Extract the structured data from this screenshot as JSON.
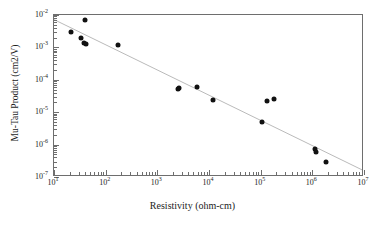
{
  "chart_data": {
    "type": "scatter",
    "title": "",
    "xlabel": "Resistivity (ohm-cm)",
    "ylabel": "Mu-Tau Product (cm2/V)",
    "xscale": "log",
    "yscale": "log",
    "xlim": [
      10,
      10000000
    ],
    "ylim": [
      1e-07,
      0.01
    ],
    "grid": false,
    "legend": null,
    "xticks": [
      {
        "value": 10,
        "label": "10",
        "exp": "1"
      },
      {
        "value": 100,
        "label": "10",
        "exp": "2"
      },
      {
        "value": 1000,
        "label": "10",
        "exp": "3"
      },
      {
        "value": 10000,
        "label": "10",
        "exp": "4"
      },
      {
        "value": 100000,
        "label": "10",
        "exp": "5"
      },
      {
        "value": 1000000,
        "label": "10",
        "exp": "6"
      },
      {
        "value": 10000000,
        "label": "10",
        "exp": "7"
      }
    ],
    "yticks": [
      {
        "value": 0.01,
        "label": "10",
        "exp": "-2"
      },
      {
        "value": 0.001,
        "label": "10",
        "exp": "-3"
      },
      {
        "value": 0.0001,
        "label": "10",
        "exp": "-4"
      },
      {
        "value": 1e-05,
        "label": "10",
        "exp": "-5"
      },
      {
        "value": 1e-06,
        "label": "10",
        "exp": "-6"
      },
      {
        "value": 1e-07,
        "label": "10",
        "exp": "-7"
      }
    ],
    "series": [
      {
        "name": "Mu-Tau vs Resistivity",
        "marker": "filled-circle",
        "color": "#111111",
        "points": [
          {
            "x": 21,
            "y": 0.0029
          },
          {
            "x": 33,
            "y": 0.0019
          },
          {
            "x": 40,
            "y": 0.007
          },
          {
            "x": 38,
            "y": 0.0014
          },
          {
            "x": 42,
            "y": 0.0013
          },
          {
            "x": 170,
            "y": 0.0012
          },
          {
            "x": 2500,
            "y": 5.2e-05
          },
          {
            "x": 2600,
            "y": 5.7e-05
          },
          {
            "x": 5800,
            "y": 6.2e-05
          },
          {
            "x": 12000,
            "y": 2.3e-05
          },
          {
            "x": 105000,
            "y": 5e-06
          },
          {
            "x": 130000,
            "y": 2.22e-05
          },
          {
            "x": 180000,
            "y": 2.55e-05
          },
          {
            "x": 1150000,
            "y": 7.5e-07
          },
          {
            "x": 1200000,
            "y": 6e-07
          },
          {
            "x": 1800000,
            "y": 3e-07
          }
        ]
      }
    ],
    "fit_line": {
      "name": "power-law trend",
      "color": "#b9b9b9",
      "x_start": 10,
      "y_start": 0.0072,
      "x_end": 10000000,
      "y_end": 1.45e-07
    }
  }
}
